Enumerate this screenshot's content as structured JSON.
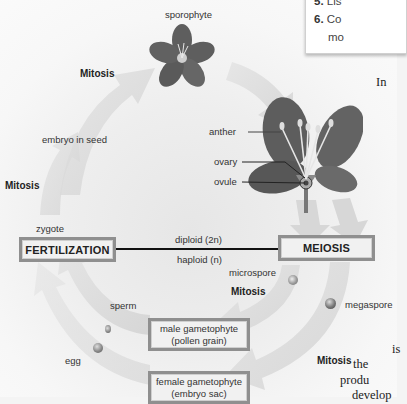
{
  "diagram": {
    "labels": {
      "sporophyte": "sporophyte",
      "mitosis_top": "Mitosis",
      "embryo_in_seed": "embryo in seed",
      "mitosis_left": "Mitosis",
      "zygote": "zygote",
      "diploid": "diploid (2n)",
      "haploid": "haploid (n)",
      "anther": "anther",
      "ovary": "ovary",
      "ovule": "ovule",
      "microspore": "microspore",
      "mitosis_mid": "Mitosis",
      "megaspore": "megaspore",
      "sperm": "sperm",
      "egg": "egg",
      "mitosis_bottom": "Mitosis"
    },
    "boxes": {
      "fertilization": "FERTILIZATION",
      "meiosis": "MEIOSIS",
      "male_gametophyte_line1": "male gametophyte",
      "male_gametophyte_line2": "(pollen grain)",
      "female_gametophyte_line1": "female gametophyte",
      "female_gametophyte_line2": "(embryo sac)"
    },
    "colors": {
      "arrow": "#d9d9d9",
      "box_border": "#8f8f8f",
      "petal": "#5a5a5a",
      "divider_line": "#111111"
    }
  },
  "sidebar_questions": {
    "items": [
      {
        "num": "5.",
        "text": "Lis"
      },
      {
        "num": "6.",
        "text": "Co"
      },
      {
        "num": "",
        "text": "mo"
      }
    ]
  },
  "body_text": {
    "fragments": [
      "In",
      "is",
      "the",
      "produ",
      "develop"
    ]
  }
}
